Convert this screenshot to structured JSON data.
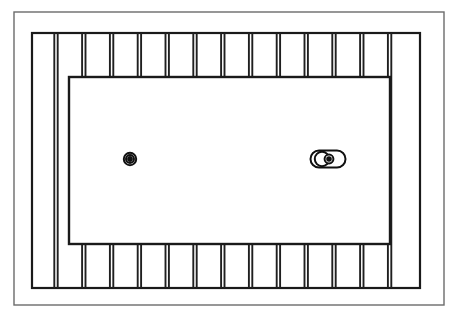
{
  "drawing": {
    "title": "Ribbed Rectangular Panel - Plan View",
    "domain_type": "diagram",
    "canvas": {
      "width": 459,
      "height": 319,
      "background": "#ffffff"
    },
    "stroke": {
      "outer_border_color": "#6b6b6b",
      "outer_border_width": 1.4,
      "frame_color": "#1a1a1a",
      "frame_width": 2.2,
      "rib_color": "#1f1f1f",
      "rib_width": 1.9,
      "panel_color": "#1a1a1a",
      "panel_width": 2.4,
      "feature_color": "#111111",
      "feature_width": 2.0
    },
    "outer_border": {
      "label": "outer-border-rectangle",
      "x": 14,
      "y": 12,
      "width": 430,
      "height": 293
    },
    "rib_frame": {
      "label": "rib-band-frame-rectangle",
      "x": 32,
      "y": 33,
      "width": 388,
      "height": 255
    },
    "center_panel": {
      "label": "center-panel-rectangle",
      "x": 69,
      "y": 77,
      "width": 321,
      "height": 167,
      "fill": "#ffffff"
    },
    "ribs": {
      "label": "vertical-rib-pairs",
      "count": 13,
      "pair_gap": 3.4,
      "first_pair_center_x": 56,
      "pitch": 27.8,
      "top_band": {
        "y_start": 33,
        "y_end": 77
      },
      "bottom_band": {
        "y_start": 244,
        "y_end": 288
      },
      "full_height_left_pair_x": 56,
      "full_height_right_pair_x": 397
    },
    "features": [
      {
        "id": "boss-left",
        "label": "concentric-circle-boss",
        "type": "concentric-circle",
        "cx": 130,
        "cy": 159,
        "outer_r": 6.2,
        "mid_r": 4.0,
        "inner_r": 1.9
      },
      {
        "id": "slot-right",
        "label": "oblong-slot-with-bosses",
        "type": "obround-slot",
        "cx": 328,
        "cy": 159,
        "slot_half_length": 17.5,
        "slot_half_height": 8.5,
        "inner_circle_left": {
          "cx": 322,
          "cy": 159,
          "r": 7.2
        },
        "inner_circle_mid": {
          "cx": 329,
          "cy": 159,
          "r": 4.4
        },
        "inner_circle_dot": {
          "cx": 329,
          "cy": 159,
          "r": 1.8
        }
      }
    ]
  }
}
